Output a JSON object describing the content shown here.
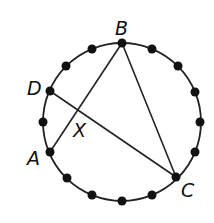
{
  "diagram": {
    "title": "",
    "circle": {
      "cx": 122,
      "cy": 122,
      "r": 79,
      "stroke": "#222222"
    },
    "dot_count": 16,
    "dots": [
      [
        122,
        43
      ],
      [
        152,
        49
      ],
      [
        178,
        66
      ],
      [
        195,
        92
      ],
      [
        201,
        122
      ],
      [
        195,
        152
      ],
      [
        178,
        178
      ],
      [
        152,
        195
      ],
      [
        122,
        201
      ],
      [
        92,
        195
      ],
      [
        66,
        178
      ],
      [
        49,
        152
      ],
      [
        43,
        122
      ],
      [
        49,
        92
      ],
      [
        66,
        66
      ],
      [
        92,
        49
      ]
    ],
    "points": {
      "B": {
        "label": "B",
        "x": 122,
        "y": 43
      },
      "C": {
        "label": "C",
        "x": 176,
        "y": 177
      },
      "A": {
        "label": "A",
        "x": 50,
        "y": 152
      },
      "D": {
        "label": "D",
        "x": 50,
        "y": 91
      },
      "X": {
        "label": "X"
      }
    },
    "segments": [
      "AB",
      "BC",
      "DC"
    ],
    "labels": {
      "B": "B",
      "C": "C",
      "A": "A",
      "D": "D",
      "X": "X"
    }
  }
}
